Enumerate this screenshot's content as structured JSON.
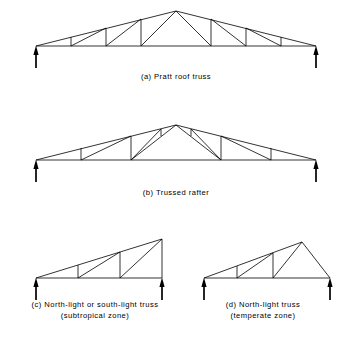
{
  "figure": {
    "background_color": "#ffffff",
    "line_color": "#000000"
  },
  "panels": [
    {
      "id": "pratt-roof-truss",
      "label": "(a)  Pratt roof truss",
      "caption_line2": "",
      "caption_x": 176,
      "caption_y": 72,
      "support_left": {
        "x": 36,
        "y": 46
      },
      "support_right": {
        "x": 316,
        "y": 46
      },
      "chords": [
        {
          "name": "bottom-chord",
          "points": "36,46 316,46"
        },
        {
          "name": "left-rafter",
          "points": "36,46 176,11"
        },
        {
          "name": "right-rafter",
          "points": "176,11 316,46"
        }
      ],
      "webs": [
        {
          "name": "web-vertical-1-left",
          "points": "71,37 71,46"
        },
        {
          "name": "web-vertical-2-left",
          "points": "106,28 106,46"
        },
        {
          "name": "web-vertical-3-left",
          "points": "141,19 141,46"
        },
        {
          "name": "web-diagonal-1-left",
          "points": "71,46 106,28"
        },
        {
          "name": "web-diagonal-2-left",
          "points": "106,46 141,19"
        },
        {
          "name": "web-diagonal-3-left",
          "points": "141,46 176,11"
        },
        {
          "name": "web-vertical-1-right",
          "points": "281,37 281,46"
        },
        {
          "name": "web-vertical-2-right",
          "points": "246,28 246,46"
        },
        {
          "name": "web-vertical-3-right",
          "points": "211,19 211,46"
        },
        {
          "name": "web-diagonal-1-right",
          "points": "281,46 246,28"
        },
        {
          "name": "web-diagonal-2-right",
          "points": "246,46 211,19"
        },
        {
          "name": "web-diagonal-3-right",
          "points": "211,46 176,11"
        }
      ]
    },
    {
      "id": "trussed-rafter",
      "label": "(b)  Trussed rafter",
      "caption_line2": "",
      "caption_x": 176,
      "caption_y": 188,
      "support_left": {
        "x": 36,
        "y": 160
      },
      "support_right": {
        "x": 316,
        "y": 160
      },
      "chords": [
        {
          "name": "bottom-chord",
          "points": "36,160 316,160"
        },
        {
          "name": "left-rafter",
          "points": "36,160 176,125"
        },
        {
          "name": "right-rafter",
          "points": "176,125 316,160"
        }
      ],
      "webs": [
        {
          "name": "web-post-1-left",
          "points": "81,148 81,160"
        },
        {
          "name": "web-diagonal-a-left",
          "points": "81,160 131,136"
        },
        {
          "name": "web-post-2-left",
          "points": "131,136 131,147"
        },
        {
          "name": "web-diagonal-b-left",
          "points": "131,147 131,160"
        },
        {
          "name": "web-diagonal-c-left",
          "points": "131,160 161,129"
        },
        {
          "name": "web-post-3-left",
          "points": "161,129 161,136"
        },
        {
          "name": "web-diagonal-d-left",
          "points": "131,160 176,125"
        },
        {
          "name": "web-post-1-right",
          "points": "271,148 271,160"
        },
        {
          "name": "web-diagonal-a-right",
          "points": "271,160 221,136"
        },
        {
          "name": "web-post-2-right",
          "points": "221,136 221,147"
        },
        {
          "name": "web-diagonal-b-right",
          "points": "221,147 221,160"
        },
        {
          "name": "web-diagonal-c-right",
          "points": "221,160 191,129"
        },
        {
          "name": "web-post-3-right",
          "points": "191,129 191,136"
        },
        {
          "name": "web-diagonal-d-right",
          "points": "221,160 176,125"
        }
      ]
    },
    {
      "id": "north-light-or-south-light-truss",
      "label": "(c)  North-light or south-light truss",
      "caption_line2": "(subtropical zone)",
      "caption_x": 95,
      "caption_y": 300,
      "support_left": {
        "x": 36,
        "y": 278
      },
      "support_right": {
        "x": 162,
        "y": 278
      },
      "chords": [
        {
          "name": "bottom-chord",
          "points": "36,278 162,278"
        },
        {
          "name": "top-chord",
          "points": "36,278 162,239"
        },
        {
          "name": "right-end-post",
          "points": "162,239 162,278"
        }
      ],
      "webs": [
        {
          "name": "web-vertical-1",
          "points": "78,265 78,278"
        },
        {
          "name": "web-vertical-2",
          "points": "120,252 120,278"
        },
        {
          "name": "web-diagonal-1",
          "points": "78,278 120,252"
        },
        {
          "name": "web-diagonal-2",
          "points": "120,278 162,239"
        }
      ]
    },
    {
      "id": "north-light-truss",
      "label": "(d)  North-light truss",
      "caption_line2": "(temperate zone)",
      "caption_x": 263,
      "caption_y": 300,
      "support_left": {
        "x": 204,
        "y": 278
      },
      "support_right": {
        "x": 330,
        "y": 278
      },
      "chords": [
        {
          "name": "bottom-chord",
          "points": "204,278 330,278"
        },
        {
          "name": "top-chord",
          "points": "204,278 302,242"
        },
        {
          "name": "right-rafter",
          "points": "302,242 330,278"
        }
      ],
      "webs": [
        {
          "name": "web-vertical-1",
          "points": "237,266 237,278"
        },
        {
          "name": "web-vertical-2",
          "points": "273,253 273,278"
        },
        {
          "name": "web-diagonal-1",
          "points": "237,278 273,253"
        },
        {
          "name": "web-diagonal-2",
          "points": "273,278 302,242"
        }
      ]
    }
  ]
}
